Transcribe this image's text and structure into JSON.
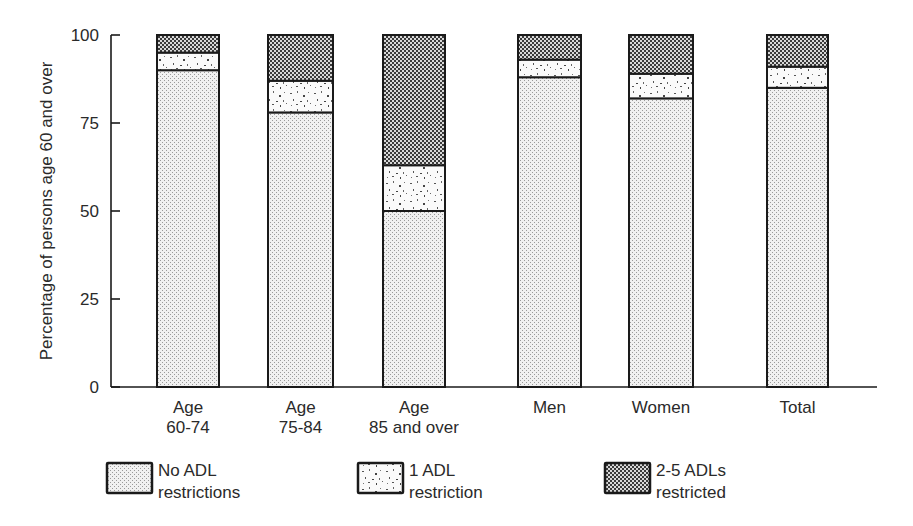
{
  "chart_data": {
    "type": "bar",
    "stacked": true,
    "title": "",
    "xlabel": "",
    "ylabel": "Percentage of persons age 60 and over",
    "ylim": [
      0,
      100
    ],
    "yticks": [
      0,
      25,
      50,
      75,
      100
    ],
    "grid": false,
    "legend_position": "bottom",
    "categories": [
      "Age 60-74",
      "Age 75-84",
      "Age 85 and over",
      "Men",
      "Women",
      "Total"
    ],
    "category_lines": [
      [
        "Age",
        "60-74"
      ],
      [
        "Age",
        "75-84"
      ],
      [
        "Age",
        "85 and over"
      ],
      [
        "Men"
      ],
      [
        "Women"
      ],
      [
        "Total"
      ]
    ],
    "series": [
      {
        "name": "No ADL restrictions",
        "legend_lines": [
          "No ADL",
          "restrictions"
        ],
        "pattern": "light-dots",
        "values": [
          90,
          78,
          50,
          88,
          82,
          85
        ]
      },
      {
        "name": "1 ADL restriction",
        "legend_lines": [
          "1 ADL",
          "restriction"
        ],
        "pattern": "speckle",
        "values": [
          5,
          9,
          13,
          5,
          7,
          6
        ]
      },
      {
        "name": "2-5 ADLs restricted",
        "legend_lines": [
          "2-5 ADLs",
          "restricted"
        ],
        "pattern": "dark-check",
        "values": [
          5,
          13,
          37,
          7,
          11,
          9
        ]
      }
    ]
  }
}
